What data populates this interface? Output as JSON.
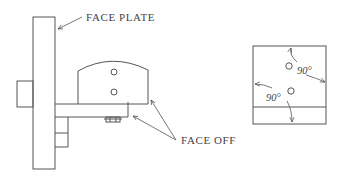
{
  "labels": {
    "face_plate": "FACE PLATE",
    "face_off": "FACE OFF"
  },
  "angles": {
    "upper": "90°",
    "lower": "90°"
  },
  "colors": {
    "line": "#555555",
    "text": "#444444",
    "background": "#ffffff"
  }
}
